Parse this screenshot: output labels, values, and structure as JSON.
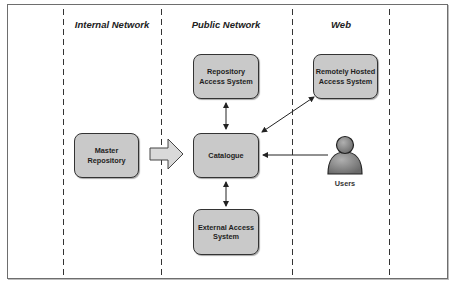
{
  "columns": [
    {
      "label": "Internal Network"
    },
    {
      "label": "Public Network"
    },
    {
      "label": "Web"
    }
  ],
  "nodes": {
    "master_repository": "Master Repository",
    "repository_access_system": "Repository Access System",
    "catalogue": "Catalogue",
    "external_access_system": "External Access System",
    "remotely_hosted_access_system": "Remotely Hosted Access System",
    "users": "Users"
  },
  "edges": [
    {
      "from": "master_repository",
      "to": "catalogue",
      "style": "block-arrow"
    },
    {
      "from": "catalogue",
      "to": "repository_access_system",
      "style": "bidirectional"
    },
    {
      "from": "catalogue",
      "to": "external_access_system",
      "style": "bidirectional"
    },
    {
      "from": "catalogue",
      "to": "remotely_hosted_access_system",
      "style": "bidirectional"
    },
    {
      "from": "users",
      "to": "catalogue",
      "style": "arrow"
    }
  ],
  "colors": {
    "box_fill": "#c9c9c9",
    "box_border": "#333333",
    "line": "#222222",
    "user_fill": "#8a8a8a"
  }
}
